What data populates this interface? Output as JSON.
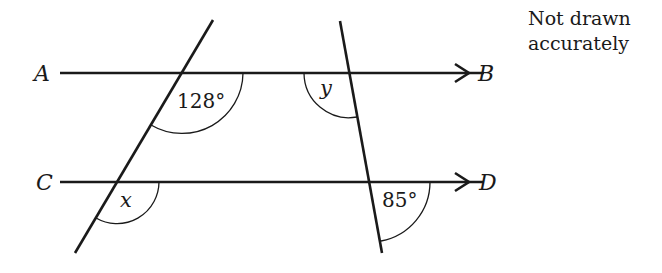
{
  "diagram": {
    "type": "parallel-lines-angles",
    "note": {
      "line1": "Not drawn",
      "line2": "accurately"
    },
    "points": {
      "A": "A",
      "B": "B",
      "C": "C",
      "D": "D"
    },
    "angles": {
      "top_left": "128°",
      "top_right": "y",
      "bottom_left": "x",
      "bottom_right": "85°"
    },
    "colors": {
      "stroke": "#1a1a1a",
      "background": "#ffffff"
    }
  }
}
